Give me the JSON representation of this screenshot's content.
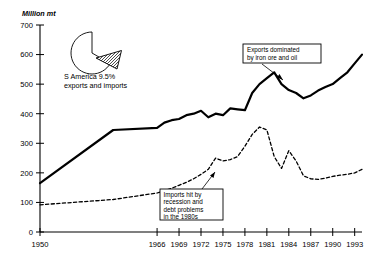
{
  "chart_data": {
    "type": "line",
    "title": "",
    "subtitle": "",
    "ylabel": "Million mt",
    "xlabel": "",
    "ylim": [
      0,
      700
    ],
    "ytick_values": [
      0,
      100,
      200,
      300,
      400,
      500,
      600,
      700
    ],
    "ytick_labels": [
      "0",
      "100",
      "200",
      "300",
      "400",
      "500",
      "600",
      "700"
    ],
    "xlim": [
      1950,
      1994
    ],
    "xtick_labels": [
      "1950",
      "1966",
      "1969",
      "1972",
      "1975",
      "1978",
      "1981",
      "1984",
      "1987",
      "1990",
      "1993"
    ],
    "xtick_values": [
      1950,
      1966,
      1969,
      1972,
      1975,
      1978,
      1981,
      1984,
      1987,
      1990,
      1993
    ],
    "grid": false,
    "legend": "none",
    "series": [
      {
        "name": "Exports",
        "style": "solid",
        "color": "#000000",
        "x": [
          1950,
          1960,
          1966,
          1967,
          1968,
          1969,
          1970,
          1971,
          1972,
          1973,
          1974,
          1975,
          1976,
          1977,
          1978,
          1979,
          1980,
          1981,
          1982,
          1983,
          1984,
          1985,
          1986,
          1987,
          1988,
          1989,
          1990,
          1991,
          1992,
          1993,
          1994
        ],
        "values": [
          165,
          345,
          352,
          370,
          378,
          382,
          395,
          400,
          410,
          388,
          400,
          395,
          418,
          415,
          412,
          470,
          500,
          520,
          540,
          500,
          480,
          470,
          452,
          462,
          478,
          490,
          500,
          520,
          540,
          570,
          600
        ]
      },
      {
        "name": "Imports",
        "style": "dashed",
        "color": "#000000",
        "x": [
          1950,
          1960,
          1966,
          1967,
          1968,
          1969,
          1970,
          1971,
          1972,
          1973,
          1974,
          1975,
          1976,
          1977,
          1978,
          1979,
          1980,
          1981,
          1982,
          1983,
          1984,
          1985,
          1986,
          1987,
          1988,
          1989,
          1990,
          1991,
          1992,
          1993,
          1994
        ],
        "values": [
          92,
          110,
          132,
          140,
          148,
          158,
          168,
          180,
          195,
          212,
          250,
          240,
          245,
          255,
          290,
          330,
          355,
          345,
          255,
          215,
          275,
          240,
          190,
          180,
          178,
          182,
          188,
          192,
          195,
          200,
          212
        ]
      }
    ],
    "inset_pie": {
      "label_line1": "S America 9.5%",
      "label_line2": "exports and imports",
      "slices": [
        {
          "name": "S America",
          "value": 9.5,
          "fill": "hatched",
          "exploded": true
        },
        {
          "name": "Rest of world",
          "value": 90.5,
          "fill": "white",
          "exploded": false
        }
      ]
    },
    "annotations": [
      {
        "id": "exports-callout",
        "lines": [
          "Exports dominated",
          "by iron ore and oil"
        ],
        "points_to": "exports-line"
      },
      {
        "id": "imports-callout",
        "lines": [
          "Imports hit by",
          "recession and",
          "debt problems",
          "in the 1980s"
        ],
        "points_to": "imports-line"
      }
    ]
  }
}
